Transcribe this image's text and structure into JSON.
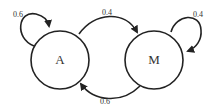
{
  "diagram": {
    "type": "markov-chain",
    "nodes": [
      {
        "id": "A",
        "label": "A"
      },
      {
        "id": "M",
        "label": "M"
      }
    ],
    "edges": [
      {
        "from": "A",
        "to": "A",
        "label": "0.6"
      },
      {
        "from": "A",
        "to": "M",
        "label": "0.4"
      },
      {
        "from": "M",
        "to": "M",
        "label": "0.4"
      },
      {
        "from": "M",
        "to": "A",
        "label": "0.6"
      }
    ]
  }
}
